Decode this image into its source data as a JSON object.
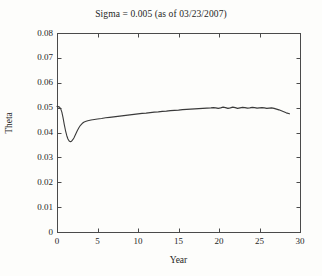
{
  "chart_data": {
    "type": "line",
    "title": "Sigma = 0.005 (as of 03/23/2007)",
    "xlabel": "Year",
    "ylabel": "Theta",
    "xlim": [
      0,
      30
    ],
    "ylim": [
      0,
      0.08
    ],
    "grid": false,
    "legend": null,
    "xticks": [
      0,
      5,
      10,
      15,
      20,
      25,
      30
    ],
    "xtick_labels": [
      "0",
      "5",
      "10",
      "15",
      "20",
      "25",
      "30"
    ],
    "yticks": [
      0,
      0.01,
      0.02,
      0.03,
      0.04,
      0.05,
      0.06,
      0.07,
      0.08
    ],
    "ytick_labels": [
      "0",
      "0.01",
      "0.02",
      "0.03",
      "0.04",
      "0.05",
      "0.06",
      "0.07",
      "0.08"
    ],
    "series": [
      {
        "name": "Theta",
        "color": "#3a3a3a",
        "x": [
          0.0,
          0.15,
          0.3,
          0.45,
          0.6,
          0.75,
          0.9,
          1.05,
          1.2,
          1.35,
          1.5,
          1.65,
          1.8,
          1.95,
          2.1,
          2.3,
          2.5,
          2.7,
          2.9,
          3.1,
          3.3,
          3.5,
          3.8,
          4.2,
          4.6,
          5.0,
          5.5,
          6.0,
          6.5,
          7.0,
          7.5,
          8.0,
          8.5,
          9.0,
          9.5,
          10.0,
          10.5,
          11.0,
          11.5,
          12.0,
          12.5,
          13.0,
          13.5,
          14.0,
          14.5,
          15.0,
          15.5,
          16.0,
          16.5,
          17.0,
          17.5,
          18.0,
          18.5,
          19.0,
          19.3,
          19.6,
          19.9,
          20.2,
          20.5,
          20.8,
          21.1,
          21.4,
          21.7,
          22.0,
          22.3,
          22.6,
          22.9,
          23.2,
          23.5,
          23.8,
          24.1,
          24.4,
          24.7,
          25.0,
          25.3,
          25.6,
          25.9,
          26.2,
          26.5,
          26.8,
          27.1,
          27.4,
          27.7,
          28.0,
          28.3,
          28.7
        ],
        "y": [
          0.0505,
          0.0504,
          0.0502,
          0.0496,
          0.0482,
          0.0459,
          0.0432,
          0.0408,
          0.0388,
          0.0374,
          0.0366,
          0.0363,
          0.0365,
          0.0371,
          0.0379,
          0.0393,
          0.0407,
          0.0419,
          0.0429,
          0.0436,
          0.0441,
          0.0444,
          0.0447,
          0.045,
          0.0452,
          0.0454,
          0.0456,
          0.0459,
          0.0461,
          0.0463,
          0.0465,
          0.0467,
          0.0469,
          0.0471,
          0.0473,
          0.0475,
          0.0477,
          0.0478,
          0.048,
          0.0482,
          0.0483,
          0.0485,
          0.0486,
          0.0488,
          0.0489,
          0.049,
          0.0492,
          0.0493,
          0.0494,
          0.0495,
          0.0496,
          0.0497,
          0.0498,
          0.0499,
          0.05,
          0.0499,
          0.0497,
          0.0499,
          0.0502,
          0.05,
          0.0497,
          0.0499,
          0.0502,
          0.05,
          0.0497,
          0.0499,
          0.0501,
          0.05,
          0.0498,
          0.0499,
          0.0501,
          0.05,
          0.0498,
          0.0499,
          0.05,
          0.0499,
          0.0497,
          0.0498,
          0.0499,
          0.0497,
          0.0494,
          0.0491,
          0.0487,
          0.0483,
          0.0479,
          0.0475
        ]
      }
    ]
  },
  "figure": {
    "background_color": "#fdfdfb",
    "axis_color": "#4a4a4a",
    "line_color": "#3a3a3a"
  }
}
